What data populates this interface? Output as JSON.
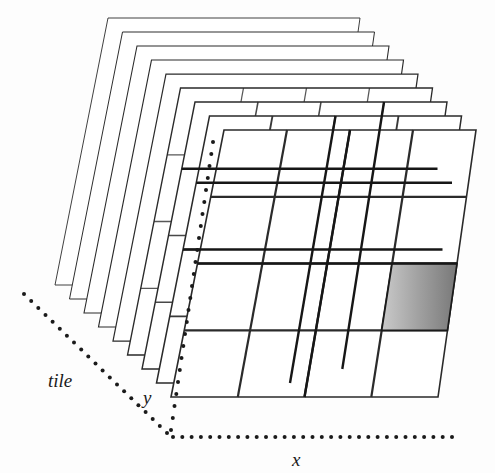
{
  "figure": {
    "background_color": "#fdfdfd",
    "width": 495,
    "height": 473
  },
  "axes": [
    {
      "id": "x",
      "label": "x",
      "style": "dotted",
      "direction": "horizontal-right",
      "label_position": {
        "x": 292,
        "y": 466
      },
      "line": {
        "x1": 173,
        "y1": 437,
        "x2": 452,
        "y2": 437
      },
      "dot_count": 30,
      "dot_radius": 2.0,
      "color": "#1a1a1a"
    },
    {
      "id": "y",
      "label": "y",
      "style": "dotted",
      "direction": "vertical-up",
      "label_position": {
        "x": 143,
        "y": 404
      },
      "line": {
        "x1": 171,
        "y1": 430,
        "x2": 213,
        "y2": 142
      },
      "dot_count": 24,
      "dot_radius": 2.0,
      "color": "#1a1a1a"
    },
    {
      "id": "tile",
      "label": "tile",
      "style": "dotted",
      "direction": "diagonal-upper-left",
      "label_position": {
        "x": 48,
        "y": 387
      },
      "line": {
        "x1": 167,
        "y1": 433,
        "x2": 24,
        "y2": 294
      },
      "dot_count": 20,
      "dot_radius": 2.0,
      "color": "#1a1a1a"
    }
  ],
  "stack": {
    "plane_count": 9,
    "offset_per_plane": {
      "dx": 14.5,
      "dy": 14.0
    },
    "plane_shape": "parallelogram",
    "plane_corners": {
      "top_left": {
        "x": 108,
        "y": 18
      },
      "top_right": {
        "x": 360,
        "y": 18
      },
      "bottom_right": {
        "x": 322,
        "y": 285
      },
      "bottom_left": {
        "x": 55,
        "y": 285
      }
    },
    "plane_skew_note": "each plane is a sheared rectangle leaning right at the top",
    "outline_color": "#2a2a2a",
    "outline_width_back": 0.9,
    "outline_width_front": 1.6,
    "fill_color": "#ffffff",
    "grid": {
      "columns": 4,
      "rows": 4,
      "line_color": "#2b2b2b",
      "line_width_back": 0.8,
      "line_width_front": 2.2
    }
  },
  "highlighted_tiles": [
    {
      "id": "tile-upper-left",
      "plane_index": 6,
      "grid_cell": {
        "col": 1,
        "row": 1
      },
      "fill_start": "#b9b9b9",
      "fill_end": "#7c7c7c",
      "gradient_direction": "diagonal",
      "border_color": "#1a1a1a"
    },
    {
      "id": "tile-lower-right",
      "plane_index": 8,
      "grid_cell": {
        "col": 3,
        "row": 2
      },
      "fill_start": "#c6c6c6",
      "fill_end": "#7a7a7a",
      "gradient_direction": "horizontal",
      "border_color": "#1a1a1a"
    }
  ]
}
